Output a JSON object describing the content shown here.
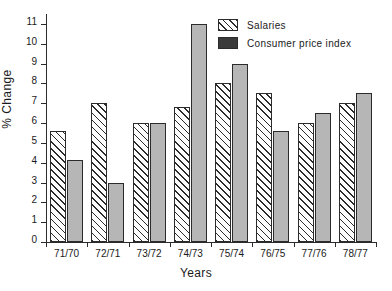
{
  "chart_data": {
    "type": "bar",
    "title": "",
    "xlabel": "Years",
    "ylabel": "% Change",
    "categories": [
      "71/70",
      "72/71",
      "73/72",
      "74/73",
      "75/74",
      "76/75",
      "77/76",
      "78/77"
    ],
    "series": [
      {
        "name": "Salaries",
        "values": [
          5.6,
          7.0,
          6.0,
          6.8,
          8.0,
          7.5,
          6.0,
          7.0
        ]
      },
      {
        "name": "Consumer price index",
        "values": [
          4.15,
          3.0,
          6.0,
          11.0,
          9.0,
          5.6,
          6.5,
          7.5
        ]
      }
    ],
    "ylim": [
      0,
      11.5
    ],
    "yticks": [
      0,
      1,
      2,
      3,
      4,
      5,
      6,
      7,
      8,
      9,
      10,
      11
    ],
    "ytick_labels": [
      "0",
      "1",
      "2",
      "3",
      "4",
      "5",
      "6",
      "7",
      "8",
      "9",
      "10",
      "11"
    ],
    "grid": false,
    "legend_position": "top-right",
    "colors": {
      "salaries_fill": "#fdfdfd",
      "salaries_hatch": "#2b2b2b",
      "cpi_fill": "#b6b6b6",
      "cpi_legend_fill": "#3a3a3a",
      "axis": "#2b2b2b",
      "text": "#1a1a1a",
      "background": "#ffffff"
    }
  },
  "legend": {
    "items": [
      {
        "label": "Salaries",
        "swatch": "hatched-swatch"
      },
      {
        "label": "Consumer price index",
        "swatch": "solid-swatch"
      }
    ]
  }
}
